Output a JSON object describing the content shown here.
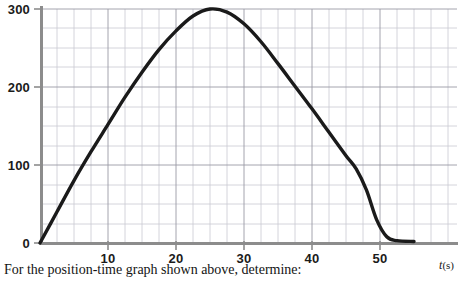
{
  "caption": {
    "text": "For the position-time graph shown above, determine:"
  },
  "axis_label_x": {
    "symbol": "t",
    "unit": "(s)"
  },
  "colors": {
    "curve": "#1a1a1a",
    "axis": "#8c8c8c",
    "grid_major": "#9a9aa5",
    "grid_minor": "#c9c9d2",
    "text": "#1b1b1b",
    "background": "#ffffff"
  },
  "chart_data": {
    "type": "line",
    "title": "",
    "xlabel": "t(s)",
    "ylabel": "",
    "xlim": [
      0,
      55
    ],
    "ylim": [
      0,
      300
    ],
    "grid": true,
    "grid_major_step_x": 10,
    "grid_minor_step_x": 2.5,
    "grid_major_step_y": 100,
    "grid_minor_step_y": 25,
    "legend": "none",
    "xticks": [
      10,
      20,
      30,
      40,
      50
    ],
    "xtick_labels": [
      "10",
      "20",
      "30",
      "40",
      "50"
    ],
    "yticks": [
      0,
      100,
      200,
      300
    ],
    "ytick_labels": [
      "0",
      "100",
      "200",
      "300"
    ],
    "series": [
      {
        "name": "position",
        "x": [
          0,
          2.5,
          5,
          7.5,
          10,
          12.5,
          15,
          17.5,
          20,
          22.5,
          25,
          27.5,
          30,
          32.5,
          35,
          37.5,
          40,
          42.5,
          45,
          46.5,
          48,
          49.5,
          51,
          52.5,
          55
        ],
        "values": [
          0,
          40,
          80,
          117,
          152,
          187,
          219,
          248,
          272,
          291,
          300,
          296,
          281,
          258,
          230,
          201,
          172,
          142,
          112,
          95,
          68,
          30,
          8,
          3,
          2
        ]
      }
    ],
    "annotations": [
      {
        "label": "maximum",
        "x": 25,
        "y": 300
      }
    ]
  }
}
